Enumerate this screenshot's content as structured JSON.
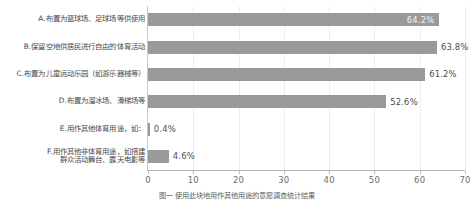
{
  "chart_data": {
    "type": "bar",
    "orientation": "horizontal",
    "title": "",
    "xlabel": "",
    "ylabel": "",
    "xlim": [
      0,
      70
    ],
    "xticks": [
      "0",
      "10",
      "20",
      "30",
      "40",
      "50",
      "60",
      "70"
    ],
    "grid": true,
    "legend": null,
    "bar_color": "#9a9a9a",
    "categories": [
      "A.布置为篮球场、足球场等供使用",
      "B.保留空地供居民进行自由的体育活动",
      "C.布置为儿童运动乐园（如游乐器械等）",
      "D.布置为溜冰场、滑梯场等",
      "E.用作其他体育用途，如：",
      "F.用作其他非体育用途，如搭建\n群众活动舞台、露天电影等"
    ],
    "values": [
      64.2,
      63.8,
      61.2,
      52.6,
      0.4,
      4.6
    ],
    "value_labels": [
      "64.2%",
      "63.8%",
      "61.2%",
      "52.6%",
      "0.4%",
      "4.6%"
    ],
    "label_placement": [
      "inside",
      "outside",
      "outside",
      "outside",
      "outside",
      "outside"
    ]
  },
  "caption": "图一 使用此块地用作其他用途的意愿调查统计结果"
}
